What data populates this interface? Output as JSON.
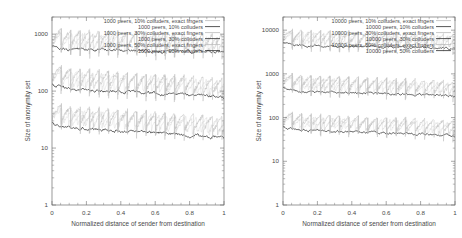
{
  "figure": {
    "background": "#ffffff",
    "panel_count": 2
  },
  "panels": [
    {
      "id": "left",
      "xlabel": "Normalized distance of sender from destination",
      "ylabel": "Size of anonymity set",
      "xticks": [
        "0",
        "0.2",
        "0.4",
        "0.6",
        "0.8",
        "1"
      ],
      "xtickvals": [
        0,
        0.2,
        0.4,
        0.6,
        0.8,
        1
      ],
      "yticks": [
        "1",
        "10",
        "100",
        "1000"
      ],
      "ytickvals": [
        1,
        10,
        100,
        1000
      ],
      "legend": [
        {
          "label": "1000 peers, 10% colluders, exact fingers",
          "style": "light"
        },
        {
          "label": "1000 peers, 10% colluders",
          "style": "dark"
        },
        {
          "label": "1000 peers, 30% colluders, exact fingers",
          "style": "light"
        },
        {
          "label": "1000 peers, 30% colluders",
          "style": "dark"
        },
        {
          "label": "1000 peers, 50% colluders, exact fingers",
          "style": "light"
        },
        {
          "label": "1000 peers, 50% colluders",
          "style": "dark"
        }
      ]
    },
    {
      "id": "right",
      "xlabel": "Normalized distance of sender from destination",
      "ylabel": "Size of anonymity set",
      "xticks": [
        "0",
        "0.2",
        "0.4",
        "0.6",
        "0.8",
        "1"
      ],
      "xtickvals": [
        0,
        0.2,
        0.4,
        0.6,
        0.8,
        1
      ],
      "yticks": [
        "1",
        "10",
        "100",
        "1000",
        "10000"
      ],
      "ytickvals": [
        1,
        10,
        100,
        1000,
        10000
      ],
      "legend": [
        {
          "label": "10000 peers, 10% colluders, exact fingers",
          "style": "light"
        },
        {
          "label": "10000 peers, 10% colluders",
          "style": "dark"
        },
        {
          "label": "10000 peers, 30% colluders, exact fingers",
          "style": "light"
        },
        {
          "label": "10000 peers, 30% colluders",
          "style": "dark"
        },
        {
          "label": "10000 peers, 50% colluders, exact fingers",
          "style": "light"
        },
        {
          "label": "10000 peers, 50% colluders",
          "style": "dark"
        }
      ]
    }
  ],
  "chart_data": [
    {
      "type": "line",
      "panel": "left",
      "title": "",
      "xlabel": "Normalized distance of sender from destination",
      "ylabel": "Size of anonymity set",
      "xlim": [
        0,
        1
      ],
      "ylim": [
        1,
        2000
      ],
      "yscale": "log",
      "xscale": "linear",
      "grid": false,
      "legend_position": "top-right-inside",
      "x": [
        0.0,
        0.05,
        0.1,
        0.15,
        0.2,
        0.25,
        0.3,
        0.35,
        0.4,
        0.45,
        0.5,
        0.55,
        0.6,
        0.65,
        0.7,
        0.75,
        0.8,
        0.85,
        0.9,
        0.95,
        1.0
      ],
      "series": [
        {
          "name": "1000 peers, 10% colluders",
          "style": "dark",
          "values": [
            620,
            560,
            545,
            540,
            540,
            535,
            530,
            528,
            525,
            520,
            520,
            518,
            512,
            510,
            505,
            500,
            498,
            495,
            490,
            485,
            470
          ]
        },
        {
          "name": "1000 peers, 10% colluders, exact fingers",
          "style": "light",
          "values": [
            700,
            640,
            610,
            600,
            595,
            590,
            585,
            580,
            575,
            570,
            565,
            560,
            555,
            550,
            545,
            540,
            535,
            530,
            525,
            515,
            500
          ]
        },
        {
          "name": "1000 peers, 30% colluders",
          "style": "dark",
          "values": [
            130,
            118,
            112,
            108,
            106,
            104,
            102,
            100,
            99,
            97,
            96,
            95,
            93,
            91,
            90,
            88,
            86,
            84,
            82,
            80,
            76
          ]
        },
        {
          "name": "1000 peers, 30% colluders, exact fingers",
          "style": "light",
          "values": [
            160,
            140,
            132,
            126,
            122,
            120,
            118,
            115,
            112,
            110,
            108,
            106,
            104,
            102,
            100,
            98,
            96,
            94,
            92,
            89,
            85
          ]
        },
        {
          "name": "1000 peers, 50% colluders",
          "style": "dark",
          "values": [
            27,
            24,
            23,
            22.5,
            22,
            21.5,
            21,
            20.5,
            20,
            19.5,
            19.5,
            19,
            18.5,
            18,
            18,
            17.5,
            17,
            16.5,
            16,
            15.5,
            15
          ]
        },
        {
          "name": "1000 peers, 50% colluders, exact fingers",
          "style": "light",
          "values": [
            34,
            30,
            28,
            27,
            26.5,
            26,
            25.5,
            25,
            24.5,
            24,
            23.5,
            23,
            22.5,
            22,
            21.5,
            21,
            20.5,
            20,
            19.5,
            19,
            18
          ]
        }
      ]
    },
    {
      "type": "line",
      "panel": "right",
      "title": "",
      "xlabel": "Normalized distance of sender from destination",
      "ylabel": "Size of anonymity set",
      "xlim": [
        0,
        1
      ],
      "ylim": [
        1,
        20000
      ],
      "yscale": "log",
      "xscale": "linear",
      "grid": false,
      "legend_position": "top-right-inside",
      "x": [
        0.0,
        0.05,
        0.1,
        0.15,
        0.2,
        0.25,
        0.3,
        0.35,
        0.4,
        0.45,
        0.5,
        0.55,
        0.6,
        0.65,
        0.7,
        0.75,
        0.8,
        0.85,
        0.9,
        0.95,
        1.0
      ],
      "series": [
        {
          "name": "10000 peers, 10% colluders",
          "style": "dark",
          "values": [
            5200,
            4600,
            4450,
            4400,
            4350,
            4320,
            4300,
            4280,
            4250,
            4220,
            4200,
            4180,
            4150,
            4120,
            4080,
            4050,
            4020,
            3980,
            3950,
            3900,
            3800
          ]
        },
        {
          "name": "10000 peers, 10% colluders, exact fingers",
          "style": "light",
          "values": [
            6200,
            5400,
            5200,
            5100,
            5050,
            5000,
            4950,
            4900,
            4850,
            4800,
            4750,
            4700,
            4650,
            4600,
            4550,
            4500,
            4450,
            4400,
            4350,
            4280,
            4150
          ]
        },
        {
          "name": "10000 peers, 30% colluders",
          "style": "dark",
          "values": [
            480,
            420,
            400,
            390,
            385,
            380,
            375,
            370,
            366,
            362,
            358,
            354,
            350,
            345,
            340,
            336,
            330,
            325,
            320,
            312,
            300
          ]
        },
        {
          "name": "10000 peers, 30% colluders, exact fingers",
          "style": "light",
          "values": [
            620,
            520,
            490,
            475,
            465,
            458,
            450,
            444,
            438,
            432,
            426,
            420,
            414,
            408,
            400,
            394,
            388,
            380,
            372,
            362,
            345
          ]
        },
        {
          "name": "10000 peers, 50% colluders",
          "style": "dark",
          "values": [
            62,
            55,
            52,
            50,
            49,
            48.5,
            48,
            47,
            46.5,
            46,
            45.5,
            45,
            44,
            43.5,
            43,
            42,
            41.5,
            41,
            40,
            39,
            37
          ]
        },
        {
          "name": "10000 peers, 50% colluders, exact fingers",
          "style": "light",
          "values": [
            80,
            68,
            64,
            61,
            60,
            59,
            58,
            57,
            56,
            55,
            54,
            53.5,
            53,
            52,
            51,
            50,
            49,
            48,
            47,
            45.5,
            43
          ]
        }
      ]
    }
  ]
}
